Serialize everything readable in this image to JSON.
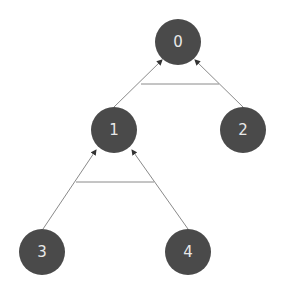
{
  "diagram": {
    "type": "tree",
    "colors": {
      "node_fill": "#4a4a4a",
      "node_text": "#e8e8e8",
      "edge": "#8a8a8a",
      "background": "#ffffff"
    },
    "nodes": [
      {
        "id": "0",
        "label": "0",
        "cx": 178,
        "cy": 42
      },
      {
        "id": "1",
        "label": "1",
        "cx": 114,
        "cy": 130
      },
      {
        "id": "2",
        "label": "2",
        "cx": 243,
        "cy": 130
      },
      {
        "id": "3",
        "label": "3",
        "cx": 42,
        "cy": 252
      },
      {
        "id": "4",
        "label": "4",
        "cx": 188,
        "cy": 252
      }
    ],
    "edges": [
      {
        "from": "1",
        "to": "0"
      },
      {
        "from": "2",
        "to": "0"
      },
      {
        "from": "3",
        "to": "1"
      },
      {
        "from": "4",
        "to": "1"
      }
    ]
  }
}
